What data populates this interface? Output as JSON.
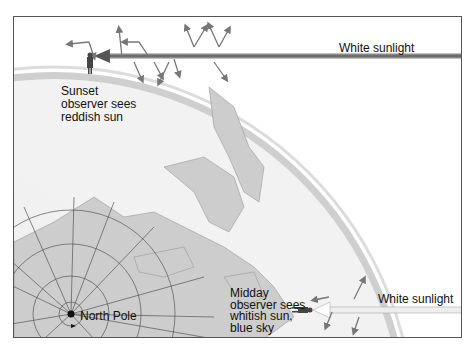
{
  "figure": {
    "labels": {
      "sunset_observer": [
        "Sunset",
        "observer sees",
        "reddish sun"
      ],
      "midday_observer": [
        "Midday",
        "observer sees",
        "whitish sun,",
        "blue sky"
      ],
      "sunlight_top": "White sunlight",
      "sunlight_bottom": "White sunlight",
      "north_pole": "North Pole"
    },
    "colors": {
      "sky_dark": "#9a9a9a",
      "sky_light": "#ffffff",
      "earth": "#e8e8e8",
      "land": "#c8c8c8",
      "grid": "#555555",
      "arrow_top": "#6a6a6a",
      "arrow_bottom": "#ffffff",
      "scatter_arrow": "#777777"
    }
  }
}
